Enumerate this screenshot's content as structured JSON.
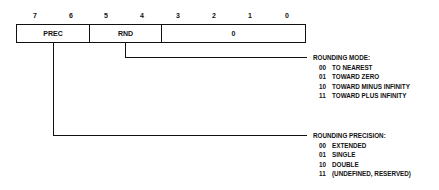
{
  "diagram": {
    "type": "register-bit-field",
    "bit_numbers": [
      "7",
      "6",
      "5",
      "4",
      "3",
      "2",
      "1",
      "0"
    ],
    "fields": [
      {
        "name": "PREC",
        "bits": "7-6"
      },
      {
        "name": "RND",
        "bits": "5-4"
      },
      {
        "name": "0",
        "bits": "3-0"
      }
    ],
    "rounding_mode": {
      "title": "ROUNDING MODE:",
      "options": [
        {
          "code": "00",
          "label": "TO NEAREST"
        },
        {
          "code": "01",
          "label": "TOWARD ZERO"
        },
        {
          "code": "10",
          "label": "TOWARD MINUS INFINITY"
        },
        {
          "code": "11",
          "label": "TOWARD PLUS INFINITY"
        }
      ]
    },
    "rounding_precision": {
      "title": "ROUNDING PRECISION:",
      "options": [
        {
          "code": "00",
          "label": "EXTENDED"
        },
        {
          "code": "01",
          "label": "SINGLE"
        },
        {
          "code": "10",
          "label": "DOUBLE"
        },
        {
          "code": "11",
          "label": "(UNDEFINED, RESERVED)"
        }
      ]
    }
  }
}
